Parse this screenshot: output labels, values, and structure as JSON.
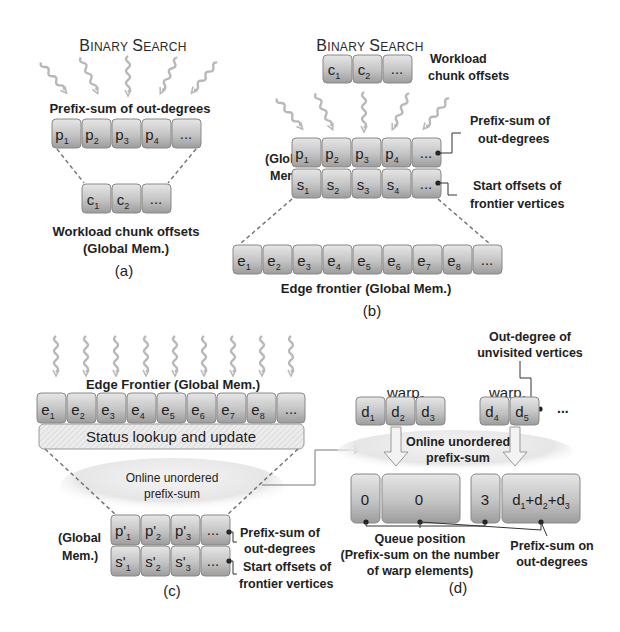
{
  "figure": {
    "panel_a": {
      "title": "Binary Search",
      "title_first_B": "B",
      "title_rest1": "INARY",
      "title_first_S": "S",
      "title_rest2": "EARCH",
      "prefix_label": "Prefix-sum of out-degrees",
      "prefix_cells": [
        {
          "base": "p",
          "sub": "1"
        },
        {
          "base": "p",
          "sub": "2"
        },
        {
          "base": "p",
          "sub": "3"
        },
        {
          "base": "p",
          "sub": "4"
        },
        {
          "base": "...",
          "sub": ""
        }
      ],
      "chunk_cells": [
        {
          "base": "c",
          "sub": "1"
        },
        {
          "base": "c",
          "sub": "2"
        },
        {
          "base": "...",
          "sub": ""
        }
      ],
      "chunk_label_line1": "Workload chunk offsets",
      "chunk_label_line2": "(Global Mem.)",
      "caption": "(a)"
    },
    "panel_b": {
      "title_first_B": "B",
      "title_rest1": "INARY",
      "title_first_S": "S",
      "title_rest2": "EARCH",
      "chunk_cells": [
        {
          "base": "c",
          "sub": "1"
        },
        {
          "base": "c",
          "sub": "2"
        },
        {
          "base": "...",
          "sub": ""
        }
      ],
      "chunk_label_line1": "Workload",
      "chunk_label_line2": "chunk offsets",
      "global_mem_line1": "(Global",
      "global_mem_line2": "Mem.)",
      "prefix_cells": [
        {
          "base": "p",
          "sub": "1"
        },
        {
          "base": "p",
          "sub": "2"
        },
        {
          "base": "p",
          "sub": "3"
        },
        {
          "base": "p",
          "sub": "4"
        },
        {
          "base": "...",
          "sub": ""
        }
      ],
      "start_cells": [
        {
          "base": "s",
          "sub": "1"
        },
        {
          "base": "s",
          "sub": "2"
        },
        {
          "base": "s",
          "sub": "3"
        },
        {
          "base": "s",
          "sub": "4"
        },
        {
          "base": "...",
          "sub": ""
        }
      ],
      "prefix_label_line1": "Prefix-sum of",
      "prefix_label_line2": "out-degrees",
      "start_label_line1": "Start offsets of",
      "start_label_line2": "frontier vertices",
      "edge_cells": [
        {
          "base": "e",
          "sub": "1"
        },
        {
          "base": "e",
          "sub": "2"
        },
        {
          "base": "e",
          "sub": "3"
        },
        {
          "base": "e",
          "sub": "4"
        },
        {
          "base": "e",
          "sub": "5"
        },
        {
          "base": "e",
          "sub": "6"
        },
        {
          "base": "e",
          "sub": "7"
        },
        {
          "base": "e",
          "sub": "8"
        },
        {
          "base": "...",
          "sub": ""
        }
      ],
      "edge_label": "Edge frontier (Global Mem.)",
      "caption": "(b)"
    },
    "panel_c": {
      "edge_label": "Edge Frontier (Global Mem.)",
      "edge_cells": [
        {
          "base": "e",
          "sub": "1"
        },
        {
          "base": "e",
          "sub": "2"
        },
        {
          "base": "e",
          "sub": "3"
        },
        {
          "base": "e",
          "sub": "4"
        },
        {
          "base": "e",
          "sub": "5"
        },
        {
          "base": "e",
          "sub": "6"
        },
        {
          "base": "e",
          "sub": "7"
        },
        {
          "base": "e",
          "sub": "8"
        },
        {
          "base": "...",
          "sub": ""
        }
      ],
      "status_bar": "Status lookup and update",
      "online_line1": "Online unordered",
      "online_line2": "prefix-sum",
      "global_mem_line1": "(Global",
      "global_mem_line2": "Mem.)",
      "prefix_cells": [
        {
          "base": "p'",
          "sub": "1"
        },
        {
          "base": "p'",
          "sub": "2"
        },
        {
          "base": "p'",
          "sub": "3"
        },
        {
          "base": "...",
          "sub": ""
        }
      ],
      "start_cells": [
        {
          "base": "s'",
          "sub": "1"
        },
        {
          "base": "s'",
          "sub": "2"
        },
        {
          "base": "s'",
          "sub": "3"
        },
        {
          "base": "...",
          "sub": ""
        }
      ],
      "prefix_label_line1": "Prefix-sum of",
      "prefix_label_line2": "out-degrees",
      "start_label_line1": "Start offsets of",
      "start_label_line2": "frontier vertices",
      "caption": "(c)"
    },
    "panel_d": {
      "outdeg_label_line1": "Out-degree of",
      "outdeg_label_line2": "unvisited vertices",
      "warp3_base": "warp",
      "warp3_sub": "3",
      "warp1_base": "warp",
      "warp1_sub": "1",
      "warp3_cells": [
        {
          "base": "d",
          "sub": "1"
        },
        {
          "base": "d",
          "sub": "2"
        },
        {
          "base": "d",
          "sub": "3"
        }
      ],
      "warp1_cells": [
        {
          "base": "d",
          "sub": "4"
        },
        {
          "base": "d",
          "sub": "5"
        }
      ],
      "ellipsis": "...",
      "online_line1": "Online unordered",
      "online_line2": "prefix-sum",
      "result_left_pos": "0",
      "result_left_sum": "0",
      "result_right_pos": "3",
      "result_right_sum_parts": [
        "d",
        "1",
        "+d",
        "2",
        "+d",
        "3"
      ],
      "queue_label_line1": "Queue position",
      "queue_label_line2": "(Prefix-sum on the number",
      "queue_label_line3": "of warp elements)",
      "psum_label_line1": "Prefix-sum on",
      "psum_label_line2": "out-degrees",
      "caption": "(d)"
    },
    "colors": {
      "cell_top": "#e2e2e2",
      "cell_bottom": "#9a9a9a",
      "cell_stroke": "#8a8a8a",
      "squiggle": "#b5b5b5",
      "dash": "#707070",
      "text": "#1e1e1e"
    }
  }
}
